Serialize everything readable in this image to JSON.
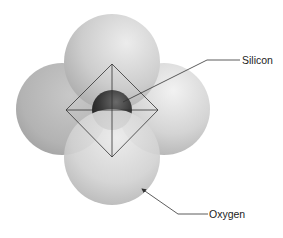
{
  "diagram": {
    "labels": {
      "silicon": "Silicon",
      "oxygen": "Oxygen"
    },
    "atoms": [
      {
        "id": "oxygen-left",
        "type": "oxygen",
        "cx": 62,
        "cy": 109,
        "r": 46
      },
      {
        "id": "oxygen-right",
        "type": "oxygen",
        "cx": 164,
        "cy": 109,
        "r": 46
      },
      {
        "id": "oxygen-top",
        "type": "oxygen",
        "cx": 112,
        "cy": 62,
        "r": 48
      },
      {
        "id": "silicon-center",
        "type": "silicon",
        "cx": 112,
        "cy": 110,
        "r": 20
      },
      {
        "id": "oxygen-bottom",
        "type": "oxygen",
        "cx": 112,
        "cy": 157,
        "r": 48
      }
    ],
    "tetrahedron_outline": {
      "top": [
        112,
        64
      ],
      "left": [
        66,
        110
      ],
      "right": [
        158,
        110
      ],
      "bottom": [
        112,
        157
      ]
    },
    "colors": {
      "oxygen_light": "#e2e2e2",
      "oxygen_mid": "#bdbdbd",
      "oxygen_dark": "#8f8f8f",
      "silicon_light": "#6a6a6a",
      "silicon_dark": "#1c1c1c",
      "line": "#333333",
      "text": "#222222"
    }
  }
}
